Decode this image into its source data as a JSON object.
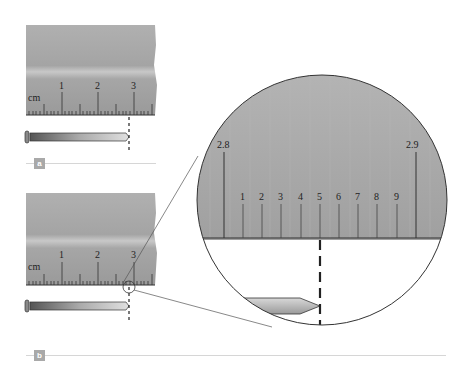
{
  "panels": [
    {
      "id": "a",
      "label": "a",
      "ruler": {
        "unit": "cm",
        "ticks": [
          "1",
          "2",
          "3"
        ]
      },
      "nail_end_cm": 2.85
    },
    {
      "id": "b",
      "label": "b",
      "ruler": {
        "unit": "cm",
        "ticks": [
          "1",
          "2",
          "3"
        ]
      },
      "nail_end_cm": 2.85
    }
  ],
  "magnifier": {
    "major_labels": [
      "2.8",
      "2.9"
    ],
    "minor_labels": [
      "1",
      "2",
      "3",
      "4",
      "5",
      "6",
      "7",
      "8",
      "9"
    ]
  },
  "colors": {
    "ruler_top": "#a8a8a8",
    "ruler_band": "#c4c4c4",
    "ruler_bottom": "#9c9c9c",
    "tag": "#a9a9a9",
    "divider": "#d6d6d6"
  }
}
